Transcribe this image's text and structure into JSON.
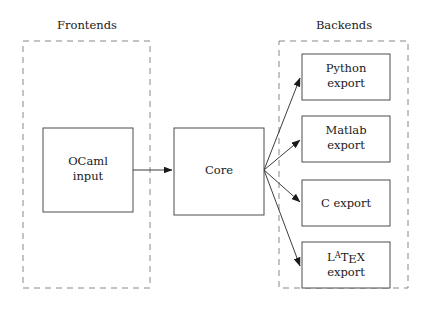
{
  "diagram": {
    "background_color": "#ffffff",
    "groups": [
      {
        "id": "frontends",
        "label": "Frontends",
        "label_x": 87,
        "label_y": 29,
        "x": 23,
        "y": 41,
        "width": 127,
        "height": 247
      },
      {
        "id": "backends",
        "label": "Backends",
        "label_x": 344,
        "label_y": 29,
        "x": 279,
        "y": 41,
        "width": 129,
        "height": 247
      }
    ],
    "nodes": [
      {
        "id": "ocaml-input",
        "lines": [
          "OCaml",
          "input"
        ],
        "x": 43,
        "y": 128,
        "width": 90,
        "height": 84,
        "text_x": 88,
        "text_y": 165,
        "line_height": 15
      },
      {
        "id": "core",
        "lines": [
          "Core"
        ],
        "x": 174,
        "y": 128,
        "width": 90,
        "height": 87,
        "text_x": 219,
        "text_y": 174,
        "line_height": 15
      },
      {
        "id": "python-export",
        "lines": [
          "Python",
          "export"
        ],
        "x": 302,
        "y": 54,
        "width": 88,
        "height": 46,
        "text_x": 346,
        "text_y": 72,
        "line_height": 15
      },
      {
        "id": "matlab-export",
        "lines": [
          "Matlab",
          "export"
        ],
        "x": 302,
        "y": 116,
        "width": 88,
        "height": 46,
        "text_x": 346,
        "text_y": 134,
        "line_height": 15
      },
      {
        "id": "c-export",
        "lines": [
          "C export"
        ],
        "x": 302,
        "y": 180,
        "width": 88,
        "height": 46,
        "text_x": 346,
        "text_y": 207,
        "line_height": 15
      },
      {
        "id": "latex-export",
        "lines": [
          "LaTeX",
          "export"
        ],
        "x": 302,
        "y": 242,
        "width": 88,
        "height": 46,
        "text_x": 346,
        "text_y": 261,
        "line_height": 15,
        "logo": "latex"
      }
    ],
    "edges": [
      {
        "id": "ocaml-to-core",
        "from": "ocaml-input",
        "to": "core",
        "x1": 133,
        "y1": 170,
        "x2": 172,
        "y2": 170
      },
      {
        "id": "core-to-python",
        "from": "core",
        "to": "python-export",
        "x1": 264,
        "y1": 170,
        "x2": 300,
        "y2": 78
      },
      {
        "id": "core-to-matlab",
        "from": "core",
        "to": "matlab-export",
        "x1": 264,
        "y1": 170,
        "x2": 300,
        "y2": 140
      },
      {
        "id": "core-to-c",
        "from": "core",
        "to": "c-export",
        "x1": 264,
        "y1": 170,
        "x2": 300,
        "y2": 202
      },
      {
        "id": "core-to-latex",
        "from": "core",
        "to": "latex-export",
        "x1": 264,
        "y1": 170,
        "x2": 300,
        "y2": 266
      }
    ],
    "latex_logo_parts": {
      "l": "L",
      "a": "A",
      "t": "T",
      "e": "E",
      "x": "X"
    }
  }
}
